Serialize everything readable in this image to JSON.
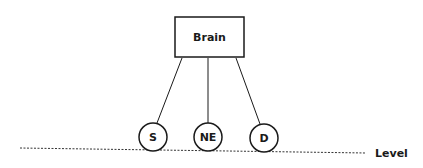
{
  "diagram": {
    "root": {
      "label": "Brain"
    },
    "nodes": [
      {
        "id": "s",
        "label": "S"
      },
      {
        "id": "ne",
        "label": "NE"
      },
      {
        "id": "d",
        "label": "D"
      }
    ],
    "baseline": {
      "label": "Level"
    },
    "colors": {
      "stroke": "#1a1a1a",
      "background": "#ffffff"
    }
  }
}
